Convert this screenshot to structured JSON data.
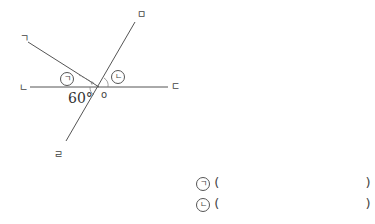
{
  "figure": {
    "points": {
      "g": "ㄱ",
      "n": "ㄴ",
      "d": "ㄷ",
      "r": "ㄹ",
      "m": "ㅁ",
      "o": "o"
    },
    "angle_label": "60°",
    "angle_marks": {
      "a": "ㄱ",
      "b": "ㄴ"
    }
  },
  "answers": [
    {
      "mark": "ㄱ",
      "open": "(",
      "value": "",
      "close": ")"
    },
    {
      "mark": "ㄴ",
      "open": "(",
      "value": "",
      "close": ")"
    }
  ],
  "colors": {
    "line": "#555555",
    "text": "#444444"
  }
}
